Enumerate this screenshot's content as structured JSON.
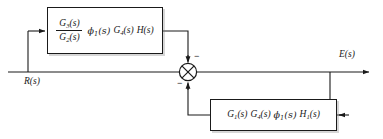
{
  "diagram": {
    "type": "control-system-block-diagram",
    "colors": {
      "background": "#ffffff",
      "line": "#1a1a1a",
      "block_border": "#1a1a1a",
      "block_fill": "#ffffff",
      "shadow": "rgba(120,120,120,0.30)"
    },
    "signals": {
      "input_label": "R(s)",
      "output_label": "E(s)"
    },
    "summing_junction": {
      "symbol": "circle-x",
      "name": "summing-junction",
      "top_input_sign": "−",
      "bottom_input_sign": "−",
      "left_input_sign": ""
    },
    "blocks": [
      {
        "id": "forward",
        "name": "forward-path-block",
        "has_fraction": true,
        "fraction": {
          "numerator_base": "G",
          "numerator_sub": "3",
          "numerator_arg": "(s)",
          "denominator_base": "G",
          "denominator_sub": "2",
          "denominator_arg": "(s)"
        },
        "terms": [
          {
            "base": "ϕ",
            "sub": "1",
            "arg": "(s)"
          },
          {
            "base": "G",
            "sub": "4",
            "arg": "(s)"
          },
          {
            "base": "H",
            "sub": "",
            "arg": "(s)"
          }
        ]
      },
      {
        "id": "feedback",
        "name": "feedback-path-block",
        "has_fraction": false,
        "terms": [
          {
            "base": "G",
            "sub": "1",
            "arg": "(s)"
          },
          {
            "base": "G",
            "sub": "4",
            "arg": "(s)"
          },
          {
            "base": "ϕ",
            "sub": "1",
            "arg": "(s)"
          },
          {
            "base": "H",
            "sub": "1",
            "arg": "(s)"
          }
        ]
      }
    ]
  }
}
